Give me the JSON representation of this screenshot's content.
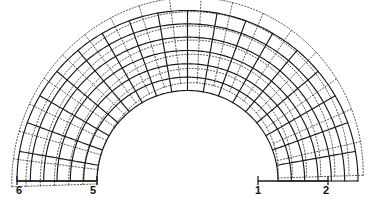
{
  "figure": {
    "background_color": "#ffffff",
    "width": 373,
    "height": 203
  },
  "node_labels": [
    {
      "id": "1",
      "text": "1",
      "x": 258,
      "y": 194
    },
    {
      "id": "2",
      "text": "2",
      "x": 326,
      "y": 194
    },
    {
      "id": "5",
      "text": "5",
      "x": 93,
      "y": 194
    },
    {
      "id": "6",
      "text": "6",
      "x": 19,
      "y": 194
    }
  ],
  "geometry": {
    "center_x": 187.5,
    "base_y": 181.0,
    "inner_radius": 90.5,
    "outer_radius": 170.5,
    "start_angle_deg": 0,
    "end_angle_deg": 180,
    "radial_divisions": 6,
    "circumferential_divisions": 18
  },
  "deformed": {
    "line_style": "dotted",
    "color": "#3a3a3a",
    "radial_scale": 1.065,
    "rotation_deg": -7.5,
    "sway_amplitude": 10.0,
    "description": "Dotted overlay showing displaced mesh, swayed and expanded relative to the solid reference mesh"
  },
  "undeformed": {
    "line_style": "solid",
    "color": "#1a1a1a",
    "description": "Solid reference mesh of the semicircular arch"
  },
  "baselines": {
    "left": {
      "x1": 17,
      "x2": 97,
      "y": 181
    },
    "right": {
      "x1": 258,
      "x2": 328,
      "y": 181
    },
    "right_dotted_extension": {
      "x1": 328,
      "x2": 358,
      "y": 181
    }
  },
  "legend": {
    "solid_label": "undeformed",
    "dotted_label": "deformed"
  },
  "chart_data": {
    "type": "line",
    "xlabel": "",
    "ylabel": "",
    "series": [
      {
        "name": "undeformed",
        "style": "solid"
      },
      {
        "name": "deformed",
        "style": "dotted"
      }
    ],
    "annotations": [
      "1",
      "2",
      "5",
      "6"
    ]
  }
}
